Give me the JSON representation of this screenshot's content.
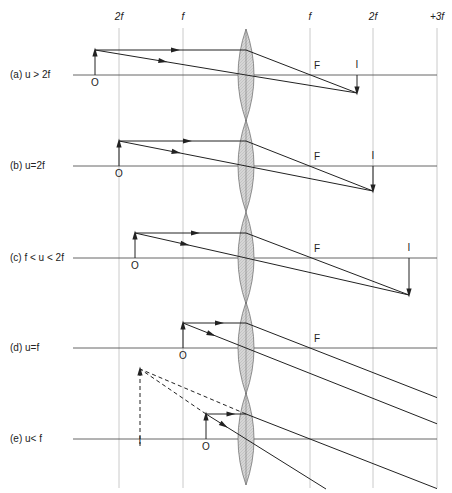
{
  "header": {
    "ticks": [
      {
        "label": "2f",
        "x": 119
      },
      {
        "label": "f",
        "x": 183
      },
      {
        "label": "f",
        "x": 310
      },
      {
        "label": "2f",
        "x": 373
      },
      {
        "label": "+3f",
        "x": 437
      }
    ]
  },
  "cases": [
    {
      "label": "(a)  u > 2f",
      "object_label": "O",
      "focus_label": "F",
      "image_label": "I",
      "axis_y": 75,
      "obj_x": 95,
      "obj_h": 25,
      "img_x": 357,
      "img_h": 18
    },
    {
      "label": "(b)  u=2f",
      "object_label": "O",
      "focus_label": "F",
      "image_label": "I",
      "axis_y": 166,
      "obj_x": 119,
      "obj_h": 25,
      "img_x": 373,
      "img_h": 25
    },
    {
      "label": "(c)  f < u < 2f",
      "object_label": "O",
      "focus_label": "F",
      "image_label": "I",
      "axis_y": 258,
      "obj_x": 135,
      "obj_h": 25,
      "img_x": 409,
      "img_h": 37
    },
    {
      "label": "(d)  u=f",
      "object_label": "O",
      "focus_label": "F",
      "axis_y": 348,
      "obj_x": 183,
      "obj_h": 25
    },
    {
      "label": "(e)  u< f",
      "object_label": "O",
      "image_label": "I",
      "axis_y": 439,
      "obj_x": 206,
      "obj_h": 25,
      "img_x": 140,
      "img_h": 70
    }
  ],
  "colors": {
    "line": "#222222",
    "grid": "#bbbbbb",
    "lens": "#d4d4d4"
  }
}
